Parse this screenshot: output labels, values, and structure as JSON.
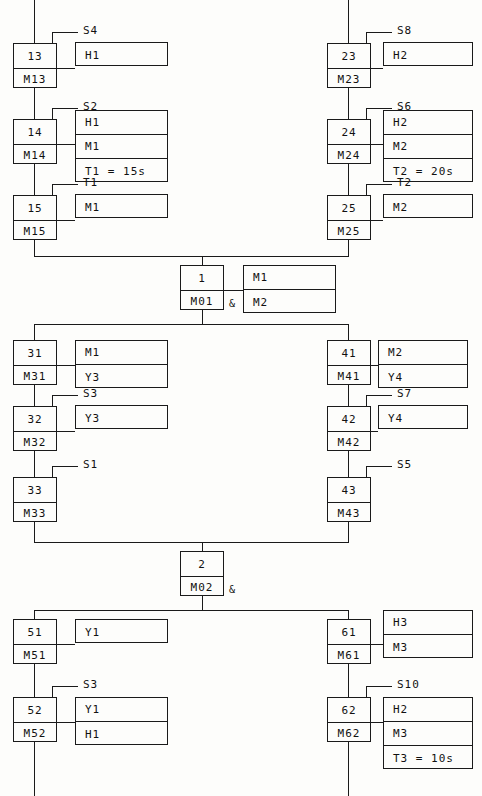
{
  "diagram": {
    "type": "sequential-function-chart",
    "line_color": "#1a1a1a",
    "background": "#fdfdfb",
    "convergence_symbol": "&"
  },
  "steps": [
    {
      "id": "s13",
      "number": "13",
      "flag": "M13",
      "x": 13,
      "y": 43,
      "transition": "S4",
      "actions": [
        "H1"
      ],
      "act_x": 75,
      "act_y": 42
    },
    {
      "id": "s14",
      "number": "14",
      "flag": "M14",
      "x": 13,
      "y": 119,
      "transition": "S2",
      "actions": [
        "H1",
        "M1",
        "T1 = 15s"
      ],
      "act_x": 75,
      "act_y": 110
    },
    {
      "id": "s15",
      "number": "15",
      "flag": "M15",
      "x": 13,
      "y": 195,
      "transition": "T1",
      "actions": [
        "M1"
      ],
      "act_x": 75,
      "act_y": 194
    },
    {
      "id": "s23",
      "number": "23",
      "flag": "M23",
      "x": 327,
      "y": 43,
      "transition": "S8",
      "actions": [
        "H2"
      ],
      "act_x": 383,
      "act_y": 42
    },
    {
      "id": "s24",
      "number": "24",
      "flag": "M24",
      "x": 327,
      "y": 119,
      "transition": "S6",
      "actions": [
        "H2",
        "M2",
        "T2 = 20s"
      ],
      "act_x": 383,
      "act_y": 110
    },
    {
      "id": "s25",
      "number": "25",
      "flag": "M25",
      "x": 327,
      "y": 195,
      "transition": "T2",
      "actions": [
        "M2"
      ],
      "act_x": 383,
      "act_y": 194
    },
    {
      "id": "s31",
      "number": "31",
      "flag": "M31",
      "x": 13,
      "y": 340,
      "transition": "",
      "actions": [
        "M1",
        "Y3"
      ],
      "act_x": 75,
      "act_y": 340
    },
    {
      "id": "s32",
      "number": "32",
      "flag": "M32",
      "x": 13,
      "y": 406,
      "transition": "S3",
      "actions": [
        "Y3"
      ],
      "act_x": 75,
      "act_y": 405
    },
    {
      "id": "s33",
      "number": "33",
      "flag": "M33",
      "x": 13,
      "y": 477,
      "transition": "S1",
      "actions": [],
      "act_x": 0,
      "act_y": 0
    },
    {
      "id": "s41",
      "number": "41",
      "flag": "M41",
      "x": 327,
      "y": 340,
      "transition": "",
      "actions": [
        "M2",
        "Y4"
      ],
      "act_x": 378,
      "act_y": 340
    },
    {
      "id": "s42",
      "number": "42",
      "flag": "M42",
      "x": 327,
      "y": 406,
      "transition": "S7",
      "actions": [
        "Y4"
      ],
      "act_x": 378,
      "act_y": 405
    },
    {
      "id": "s43",
      "number": "43",
      "flag": "M43",
      "x": 327,
      "y": 477,
      "transition": "S5",
      "actions": [],
      "act_x": 0,
      "act_y": 0
    },
    {
      "id": "s51",
      "number": "51",
      "flag": "M51",
      "x": 13,
      "y": 619,
      "transition": "",
      "actions": [
        "Y1"
      ],
      "act_x": 75,
      "act_y": 619
    },
    {
      "id": "s52",
      "number": "52",
      "flag": "M52",
      "x": 13,
      "y": 697,
      "transition": "S3",
      "actions": [
        "Y1",
        "H1"
      ],
      "act_x": 75,
      "act_y": 697
    },
    {
      "id": "s61",
      "number": "61",
      "flag": "M61",
      "x": 327,
      "y": 619,
      "transition": "",
      "actions": [
        "H3",
        "M3"
      ],
      "act_x": 383,
      "act_y": 610
    },
    {
      "id": "s62",
      "number": "62",
      "flag": "M62",
      "x": 327,
      "y": 697,
      "transition": "S10",
      "actions": [
        "H2",
        "M3",
        "T3 = 10s"
      ],
      "act_x": 383,
      "act_y": 697
    }
  ],
  "junctions": [
    {
      "id": "j1",
      "number": "1",
      "flag": "M01",
      "x": 180,
      "y": 265,
      "actions": [
        "M1",
        "M2"
      ],
      "act_x": 243,
      "act_y": 265,
      "amp": "&"
    },
    {
      "id": "j2",
      "number": "2",
      "flag": "M02",
      "x": 180,
      "y": 551,
      "actions": [],
      "act_x": 0,
      "act_y": 0,
      "amp": "&"
    }
  ],
  "labels": {
    "step_box_label": "step-number",
    "flag_box_label": "step-flag",
    "action_box_label": "action-block"
  }
}
